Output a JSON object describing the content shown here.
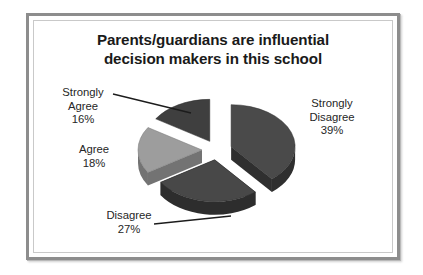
{
  "chart_data": {
    "type": "pie",
    "title": "Parents/guardians are influential decision makers in this school",
    "title_lines": [
      "Parents/guardians are influential",
      "decision makers in this school"
    ],
    "categories": [
      "Strongly Disagree",
      "Disagree",
      "Agree",
      "Strongly Agree"
    ],
    "values": [
      39,
      27,
      18,
      16
    ],
    "value_suffix": "%",
    "legend": "none",
    "exploded": true,
    "three_d": true,
    "slices": [
      {
        "label": "Strongly Disagree",
        "value": 39,
        "percent_text": "39%",
        "color": "#4a4a4a",
        "side_color": "#2f2f2f",
        "leader_line": false
      },
      {
        "label": "Disagree",
        "value": 27,
        "percent_text": "27%",
        "color": "#484848",
        "side_color": "#2d2d2d",
        "leader_line": true
      },
      {
        "label": "Agree",
        "value": 18,
        "percent_text": "18%",
        "color": "#9d9d9d",
        "side_color": "#737373",
        "leader_line": false
      },
      {
        "label": "Strongly Agree",
        "value": 16,
        "percent_text": "16%",
        "color": "#3f3f3f",
        "side_color": "#262626",
        "leader_line": true
      }
    ]
  },
  "labels": {
    "strongly_agree": {
      "name": "Strongly Agree",
      "line1": "Strongly",
      "line2": "Agree",
      "percent": "16%"
    },
    "agree": {
      "name": "Agree",
      "line1": "Agree",
      "percent": "18%"
    },
    "disagree": {
      "name": "Disagree",
      "line1": "Disagree",
      "percent": "27%"
    },
    "strongly_disagree": {
      "name": "Strongly Disagree",
      "line1": "Strongly",
      "line2": "Disagree",
      "percent": "39%"
    }
  },
  "colors": {
    "frame": "#8d8d8d",
    "frame_inner": "#c9c9c9",
    "page_background": "#ffffff",
    "text": "#262626",
    "title_text": "#1a1a1a",
    "leader_line": "#1c1c1c"
  }
}
